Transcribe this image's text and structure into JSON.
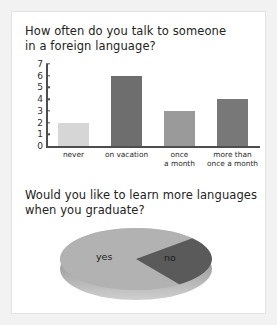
{
  "page": {
    "clipped_top_text": "",
    "background_color": "#f2f2f2",
    "card_background_color": "#ffffff"
  },
  "questions": {
    "q1_title": "How often do you talk to someone\nin a foreign language?",
    "q2_title": "Would you like to learn more languages\nwhen you graduate?"
  },
  "chart_data": [
    {
      "type": "bar",
      "title": "How often do you talk to someone in a foreign language?",
      "categories": [
        "never",
        "on vacation",
        "once a month",
        "more than once a month"
      ],
      "category_labels": [
        "never",
        "on vacation",
        "once\na month",
        "more than\nonce a month"
      ],
      "values": [
        2,
        6,
        3,
        4
      ],
      "bar_colors": [
        "#d6d6d6",
        "#6e6e6e",
        "#9a9a9a",
        "#787878"
      ],
      "xlabel": "",
      "ylabel": "",
      "ylim": [
        0,
        7
      ],
      "yticks": [
        0,
        1,
        2,
        3,
        4,
        5,
        6,
        7
      ],
      "ytick_labels": [
        "0",
        "1",
        "2",
        "3",
        "4",
        "5",
        "6",
        "7"
      ],
      "grid": false,
      "legend": "none",
      "axis_color": "#4d4d4d"
    },
    {
      "type": "pie",
      "title": "Would you like to learn more languages when you graduate?",
      "categories": [
        "yes",
        "no"
      ],
      "values": [
        73,
        27
      ],
      "labels": [
        "yes",
        "no"
      ],
      "slice_colors": [
        "#b2b2b2",
        "#5a5a5a"
      ],
      "three_d": true,
      "legend": "none",
      "start_angle_deg": 55,
      "depth_color": "#8d8d8d"
    }
  ]
}
